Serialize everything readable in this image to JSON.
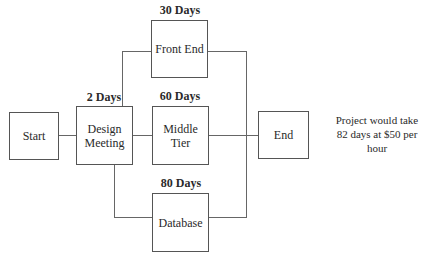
{
  "nodes": {
    "start": {
      "label": "Start"
    },
    "design": {
      "label": "Design Meeting",
      "duration": "2 Days"
    },
    "front_end": {
      "label": "Front End",
      "duration": "30 Days"
    },
    "middle_tier": {
      "label": "Middle Tier",
      "duration": "60 Days"
    },
    "database": {
      "label": "Database",
      "duration": "80 Days"
    },
    "end": {
      "label": "End"
    }
  },
  "note": "Project would take 82 days at $50 per hour",
  "edges": [
    [
      "Start",
      "Design Meeting"
    ],
    [
      "Design Meeting",
      "Front End"
    ],
    [
      "Design Meeting",
      "Middle Tier"
    ],
    [
      "Design Meeting",
      "Database"
    ],
    [
      "Front End",
      "End"
    ],
    [
      "Middle Tier",
      "End"
    ],
    [
      "Database",
      "End"
    ]
  ]
}
